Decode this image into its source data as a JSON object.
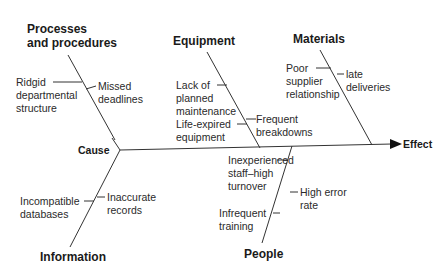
{
  "diagram": {
    "type": "fishbone",
    "cause_label": "Cause",
    "effect_label": "Effect",
    "categories": [
      {
        "name": "Processes and procedures",
        "heading_lines": [
          "Processes",
          "and procedures"
        ],
        "causes": [
          {
            "side": "left",
            "text": "Ridgid\ndepartmental\nstructure"
          },
          {
            "side": "right",
            "text": "Missed\ndeadlines"
          }
        ]
      },
      {
        "name": "Equipment",
        "causes": [
          {
            "side": "left",
            "text": "Lack of\nplanned\nmaintenance"
          },
          {
            "side": "left",
            "text": "Life-expired\nequipment"
          },
          {
            "side": "right",
            "text": "Frequent\nbreakdowns"
          }
        ]
      },
      {
        "name": "Materials",
        "causes": [
          {
            "side": "left",
            "text": "Poor\nsupplier\nrelationship"
          },
          {
            "side": "right",
            "text": "late\ndeliveries"
          }
        ]
      },
      {
        "name": "Information",
        "causes": [
          {
            "side": "left",
            "text": "Incompatible\ndatabases"
          },
          {
            "side": "right",
            "text": "Inaccurate\nrecords"
          }
        ]
      },
      {
        "name": "People",
        "causes": [
          {
            "side": "left",
            "text": "Inexperienced\nstaff–high\nturnover"
          },
          {
            "side": "left",
            "text": "Infrequent\ntraining"
          },
          {
            "side": "right",
            "text": "High error\nrate"
          }
        ]
      }
    ]
  }
}
